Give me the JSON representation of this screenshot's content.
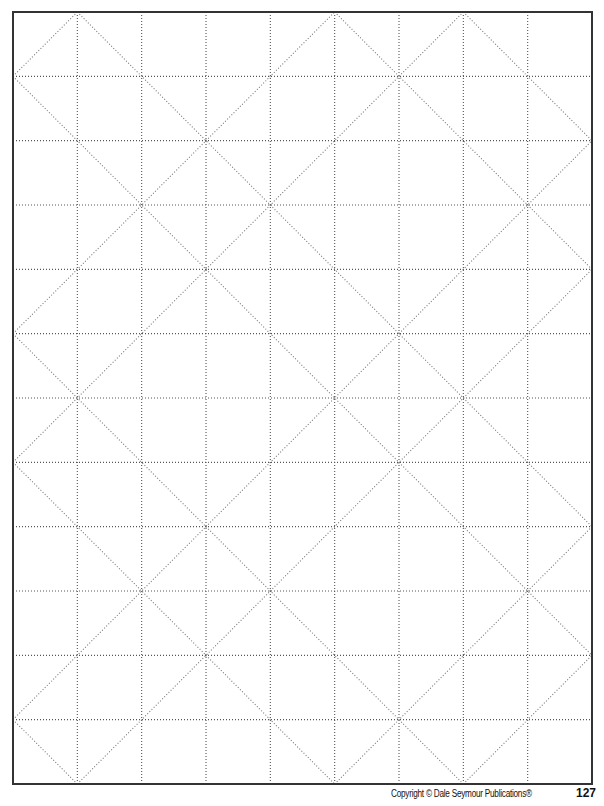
{
  "page": {
    "footer": {
      "copyright": "Copyright © Dale Seymour Publications®",
      "page_number": "127"
    }
  },
  "grid": {
    "columns": 9,
    "rows": 12,
    "frame": {
      "left": 13,
      "top": 12,
      "right": 592,
      "bottom": 784
    },
    "line_style": "dotted",
    "frame_color": "#333333",
    "grid_color": "#555555",
    "diagonal_color": "#777777",
    "diagonals": {
      "down_right_x_minus_y": [
        7,
        5,
        1,
        -1,
        -5,
        -7,
        -11
      ],
      "up_right_x_plus_y": [
        1,
        5,
        7,
        11,
        13,
        17,
        19
      ]
    }
  }
}
